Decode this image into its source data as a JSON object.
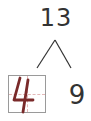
{
  "diagram": {
    "type": "number-bond",
    "whole": "13",
    "parts": {
      "left": {
        "value": "4",
        "style": "handwritten-in-grid",
        "color": "#7a2a2a"
      },
      "right": {
        "value": "9"
      }
    },
    "colors": {
      "text": "#333333",
      "grid_border": "#9a9a9a",
      "grid_guides": "#e3b8b8",
      "handwriting": "#7a2a2a"
    }
  }
}
